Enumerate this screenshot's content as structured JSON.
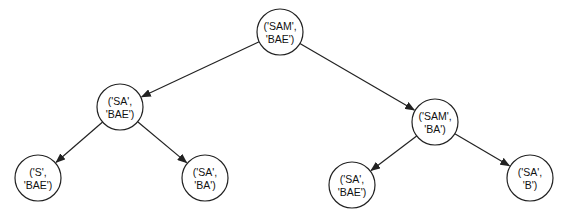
{
  "diagram": {
    "type": "tree",
    "colors": {
      "stroke": "#222222",
      "text": "#111111",
      "background": "#ffffff"
    },
    "nodes": [
      {
        "id": "root",
        "line1": "('SAM',",
        "line2": "'BAE')",
        "cx": 280,
        "cy": 32,
        "r": 23
      },
      {
        "id": "l",
        "line1": "('SA',",
        "line2": "'BAE')",
        "cx": 120,
        "cy": 107,
        "r": 23
      },
      {
        "id": "r",
        "line1": "('SAM',",
        "line2": "'BA')",
        "cx": 435,
        "cy": 122,
        "r": 23
      },
      {
        "id": "ll",
        "line1": "('S',",
        "line2": "'BAE')",
        "cx": 38,
        "cy": 178,
        "r": 23
      },
      {
        "id": "lr",
        "line1": "('SA',",
        "line2": "'BA')",
        "cx": 205,
        "cy": 178,
        "r": 23
      },
      {
        "id": "rl",
        "line1": "('SA',",
        "line2": "'BAE')",
        "cx": 352,
        "cy": 185,
        "r": 23
      },
      {
        "id": "rr",
        "line1": "('SA',",
        "line2": "'B')",
        "cx": 530,
        "cy": 178,
        "r": 23
      }
    ],
    "edges": [
      {
        "from": "root",
        "to": "l"
      },
      {
        "from": "root",
        "to": "r"
      },
      {
        "from": "l",
        "to": "ll"
      },
      {
        "from": "l",
        "to": "lr"
      },
      {
        "from": "r",
        "to": "rl"
      },
      {
        "from": "r",
        "to": "rr"
      }
    ]
  }
}
